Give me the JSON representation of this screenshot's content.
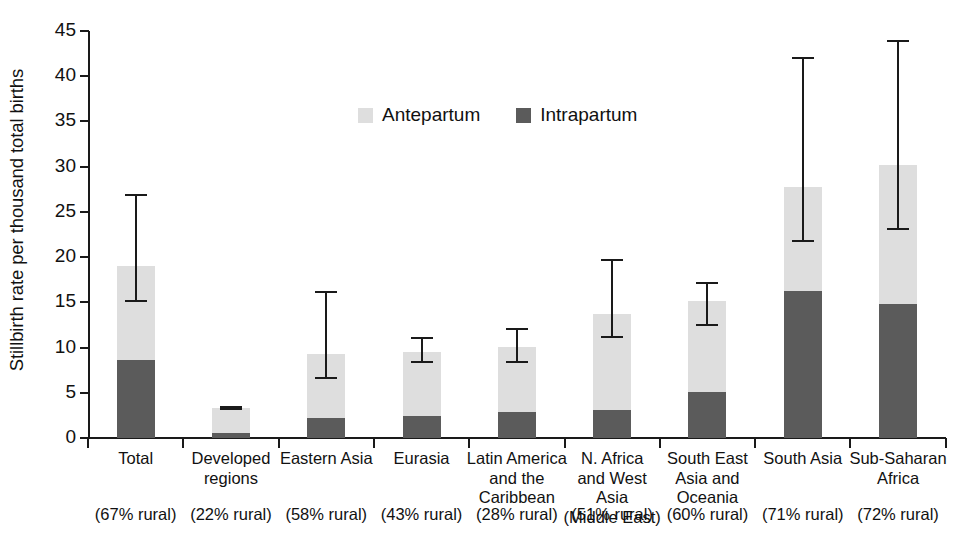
{
  "chart_data": {
    "type": "bar",
    "subtype": "stacked-bar-with-error-bars",
    "title": "",
    "xlabel": "",
    "ylabel": "Stillbirth rate per thousand total births",
    "ylim": [
      0,
      45
    ],
    "yticks": [
      0,
      5,
      10,
      15,
      20,
      25,
      30,
      35,
      40,
      45
    ],
    "ytick_labels": [
      "0",
      "5",
      "10",
      "15",
      "20",
      "25",
      "30",
      "35",
      "40",
      "45"
    ],
    "grid": false,
    "legend_position": "upper-center",
    "categories": [
      "Total",
      "Developed\nregions",
      "Eastern Asia",
      "Eurasia",
      "Latin America\nand the\nCaribbean",
      "N. Africa\nand West Asia\n(Middle East)",
      "South East\nAsia and\nOceania",
      "South Asia",
      "Sub-Saharan\nAfrica"
    ],
    "category_sublabels": [
      "(67% rural)",
      "(22% rural)",
      "(58% rural)",
      "(43% rural)",
      "(28% rural)",
      "(51% rural)",
      "(60% rural)",
      "(71% rural)",
      "(72% rural)"
    ],
    "series": [
      {
        "name": "Intrapartum",
        "color": "#5b5b5b",
        "values": [
          8.6,
          0.6,
          2.2,
          2.4,
          2.9,
          3.1,
          5.1,
          16.2,
          14.8
        ]
      },
      {
        "name": "Antepartum",
        "color": "#dedede",
        "values": [
          10.4,
          2.7,
          7.1,
          7.1,
          7.2,
          10.6,
          10.1,
          11.6,
          15.4
        ]
      }
    ],
    "totals": [
      19.0,
      3.3,
      9.3,
      9.5,
      10.1,
      13.7,
      15.2,
      27.8,
      30.2
    ],
    "error_bars": {
      "lower": [
        15.0,
        3.1,
        6.5,
        8.3,
        8.3,
        11.1,
        12.4,
        21.7,
        23.0
      ],
      "upper": [
        27.0,
        3.5,
        16.3,
        11.2,
        12.2,
        19.8,
        17.3,
        42.1,
        44.0
      ]
    }
  },
  "legend": {
    "items": [
      {
        "label": "Antepartum",
        "color": "#dedede"
      },
      {
        "label": "Intrapartum",
        "color": "#5b5b5b"
      }
    ]
  },
  "axes": {
    "y_title": "Stillbirth rate per thousand total births"
  },
  "colors": {
    "antepartum": "#dedede",
    "intrapartum": "#5b5b5b",
    "axis": "#1a1a1a",
    "background": "#ffffff"
  }
}
